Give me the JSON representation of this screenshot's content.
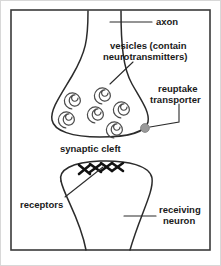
{
  "figure": {
    "background_color": "#ffffff",
    "frame_color": "#3a3a3a",
    "ink_color": "#2b2b2b",
    "text_color": "#1a1a1a",
    "vesicle_color": "#4a4a4a",
    "receptor_color": "#111111",
    "transporter_dot_color": "#9a9a9a"
  },
  "labels": {
    "axon": "axon",
    "vesicles_line1": "vesicles (contain",
    "vesicles_line2": "neurotransmitters)",
    "reuptake_line1": "reuptake",
    "reuptake_line2": "transporter",
    "synaptic_cleft": "synaptic cleft",
    "receptors": "receptors",
    "receiving_line1": "receiving",
    "receiving_line2": "neuron"
  },
  "parts": {
    "axon_name": "axon",
    "terminal_name": "axon-terminal-bouton",
    "vesicles_count": 6,
    "receptors_count": 4,
    "transporter_name": "reuptake-transporter",
    "cleft_name": "synaptic-cleft",
    "dendrite_name": "receiving-neuron-dendrite"
  }
}
